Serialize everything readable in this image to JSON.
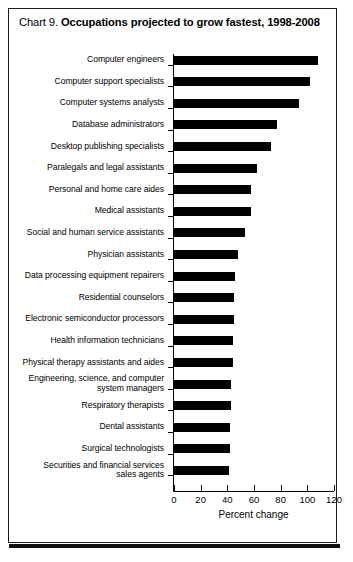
{
  "title": {
    "prefix": "Chart 9.",
    "main": "Occupations projected to grow fastest, 1998-2008"
  },
  "chart_data": {
    "type": "bar",
    "orientation": "horizontal",
    "title": "Chart 9. Occupations projected to grow fastest, 1998-2008",
    "xlabel": "Percent change",
    "ylabel": "",
    "xlim": [
      0,
      120
    ],
    "xticks": [
      0,
      20,
      40,
      60,
      80,
      100,
      120
    ],
    "grid": false,
    "legend": false,
    "bar_color": "#000000",
    "categories": [
      "Computer engineers",
      "Computer support specialists",
      "Computer systems analysts",
      "Database administrators",
      "Desktop publishing specialists",
      "Paralegals and legal assistants",
      "Personal and home care aides",
      "Medical assistants",
      "Social and human service assistants",
      "Physician assistants",
      "Data processing equipment repairers",
      "Residential counselors",
      "Electronic semiconductor processors",
      "Health information technicians",
      "Physical therapy assistants and aides",
      "Engineering, science, and computer\nsystem managers",
      "Respiratory therapists",
      "Dental assistants",
      "Surgical technologists",
      "Securities and financial services\nsales agents"
    ],
    "values": [
      108,
      102,
      94,
      77,
      73,
      62,
      58,
      58,
      53,
      48,
      46,
      45,
      45,
      44,
      44,
      43,
      43,
      42,
      42,
      41
    ]
  },
  "axis": {
    "tick_labels": [
      "0",
      "20",
      "40",
      "60",
      "80",
      "100",
      "120"
    ],
    "axis_title": "Percent change"
  }
}
